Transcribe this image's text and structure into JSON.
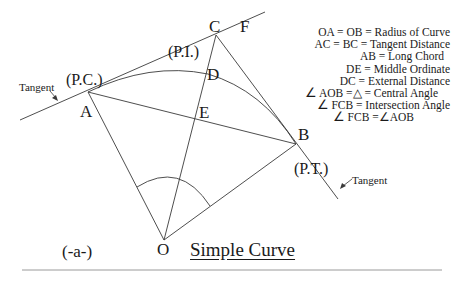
{
  "diagram": {
    "title": "Simple Curve",
    "figure_label": "(-a-)",
    "points": {
      "A": "A",
      "B": "B",
      "C": "C",
      "D": "D",
      "E": "E",
      "F": "F",
      "O": "O"
    },
    "stations": {
      "pc": "(P.C.)",
      "pi": "(P.I.)",
      "pt": "(P.T.)"
    },
    "tangent_labels": {
      "left": "Tangent",
      "right": "Tangent"
    },
    "legend": [
      {
        "text": "OA = OB = Radius of Curve"
      },
      {
        "text": "AC = BC = Tangent Distance"
      },
      {
        "text": "AB = Long Chord"
      },
      {
        "text": "DE = Middle Ordinate"
      },
      {
        "text": "DC = External Distance"
      },
      {
        "angle": "∠",
        "text": "AOB =△ = Central Angle"
      },
      {
        "angle": "∠",
        "text": "FCB = Intersection Angle"
      },
      {
        "angle": "∠",
        "text": "FCB =∠AOB"
      }
    ],
    "colors": {
      "line": "#3a3a3a",
      "text": "#1a1a1a",
      "rule": "#9a9a9a"
    }
  }
}
